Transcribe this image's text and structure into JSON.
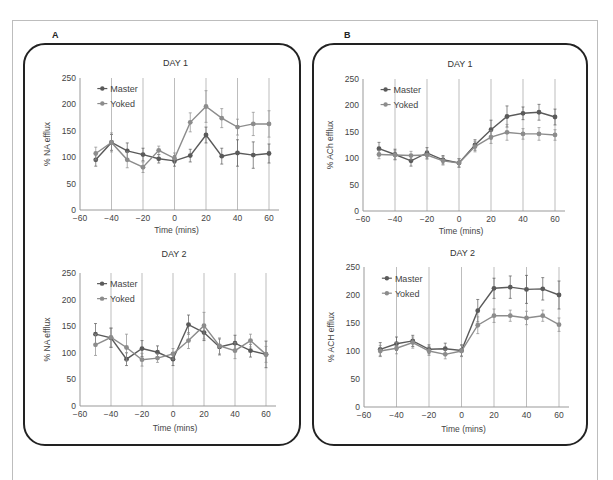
{
  "figure": {
    "panels": [
      {
        "letter": "A"
      },
      {
        "letter": "B"
      }
    ]
  },
  "colors": {
    "master": "#5a5a5a",
    "yoked": "#8c8c8c",
    "gridline": "#bdbdbd",
    "axis": "#999999",
    "frame": "#222222"
  },
  "chart_data": [
    {
      "id": "A-day1",
      "panel": "A",
      "type": "line",
      "title": "DAY 1",
      "xlabel": "Time (mins)",
      "ylabel": "% NA efflux",
      "xlim": [
        -60,
        60
      ],
      "ylim": [
        0,
        250
      ],
      "xticks": [
        -60,
        -40,
        -20,
        0,
        20,
        40,
        60
      ],
      "yticks": [
        0,
        50,
        100,
        150,
        200,
        250
      ],
      "vertical_gridlines": [
        -40,
        -20,
        0,
        20,
        40,
        60
      ],
      "legend": [
        "Master",
        "Yoked"
      ],
      "legend_position": "upper left",
      "x": [
        -50,
        -40,
        -30,
        -20,
        -10,
        0,
        10,
        20,
        30,
        40,
        50,
        60
      ],
      "series": [
        {
          "name": "Master",
          "values": [
            95,
            128,
            112,
            105,
            97,
            93,
            103,
            142,
            102,
            108,
            104,
            107
          ],
          "errors": [
            12,
            15,
            15,
            12,
            8,
            10,
            12,
            15,
            15,
            25,
            25,
            18
          ]
        },
        {
          "name": "Yoked",
          "values": [
            107,
            128,
            95,
            81,
            113,
            98,
            166,
            196,
            174,
            157,
            163,
            163
          ],
          "errors": [
            12,
            18,
            15,
            10,
            8,
            10,
            18,
            30,
            18,
            15,
            22,
            25
          ]
        }
      ]
    },
    {
      "id": "A-day2",
      "panel": "A",
      "type": "line",
      "title": "DAY 2",
      "xlabel": "Time (mins)",
      "ylabel": "% NA efflux",
      "xlim": [
        -60,
        60
      ],
      "ylim": [
        0,
        250
      ],
      "xticks": [
        -60,
        -40,
        -20,
        0,
        20,
        40,
        60
      ],
      "yticks": [
        0,
        50,
        100,
        150,
        200,
        250
      ],
      "vertical_gridlines": [
        -40,
        -20,
        0,
        20,
        40,
        60
      ],
      "legend": [
        "Master",
        "Yoked"
      ],
      "legend_position": "upper left",
      "x": [
        -50,
        -40,
        -30,
        -20,
        -10,
        0,
        10,
        20,
        30,
        40,
        50,
        60
      ],
      "series": [
        {
          "name": "Master",
          "values": [
            135,
            128,
            88,
            108,
            101,
            88,
            153,
            138,
            111,
            118,
            104,
            97
          ],
          "errors": [
            20,
            18,
            12,
            15,
            12,
            12,
            18,
            15,
            15,
            15,
            12,
            25
          ]
        },
        {
          "name": "Yoked",
          "values": [
            115,
            129,
            110,
            87,
            90,
            98,
            123,
            151,
            113,
            104,
            123,
            97
          ],
          "errors": [
            20,
            18,
            25,
            12,
            8,
            10,
            15,
            25,
            15,
            15,
            12,
            15
          ]
        }
      ]
    },
    {
      "id": "B-day1",
      "panel": "B",
      "type": "line",
      "title": "DAY 1",
      "xlabel": "Time (mins)",
      "ylabel": "% ACh efflux",
      "xlim": [
        -60,
        60
      ],
      "ylim": [
        0,
        250
      ],
      "xticks": [
        -60,
        -40,
        -20,
        0,
        20,
        40,
        60
      ],
      "yticks": [
        0,
        50,
        100,
        150,
        200,
        250
      ],
      "vertical_gridlines": [
        -40,
        -20,
        0,
        20,
        40,
        60
      ],
      "legend": [
        "Master",
        "Yoked"
      ],
      "legend_position": "upper left",
      "x": [
        -50,
        -40,
        -30,
        -20,
        -10,
        0,
        10,
        20,
        30,
        40,
        50,
        60
      ],
      "series": [
        {
          "name": "Master",
          "values": [
            118,
            107,
            95,
            110,
            97,
            91,
            125,
            154,
            179,
            185,
            187,
            178
          ],
          "errors": [
            12,
            10,
            10,
            10,
            8,
            8,
            10,
            18,
            20,
            12,
            15,
            15
          ]
        },
        {
          "name": "Yoked",
          "values": [
            107,
            106,
            105,
            106,
            95,
            91,
            122,
            140,
            149,
            146,
            146,
            144
          ],
          "errors": [
            8,
            8,
            8,
            8,
            8,
            8,
            10,
            12,
            15,
            10,
            12,
            10
          ]
        }
      ]
    },
    {
      "id": "B-day2",
      "panel": "B",
      "type": "line",
      "title": "DAY 2",
      "xlabel": "Time (mins)",
      "ylabel": "% ACH efflux",
      "xlim": [
        -60,
        60
      ],
      "ylim": [
        0,
        250
      ],
      "xticks": [
        -60,
        -40,
        -20,
        0,
        20,
        40,
        60
      ],
      "yticks": [
        0,
        50,
        100,
        150,
        200,
        250
      ],
      "vertical_gridlines": [
        -40,
        -20,
        0,
        20,
        40,
        60
      ],
      "legend": [
        "Master",
        "Yoked"
      ],
      "legend_position": "upper left",
      "x": [
        -50,
        -40,
        -30,
        -20,
        -10,
        0,
        10,
        20,
        30,
        40,
        50,
        60
      ],
      "series": [
        {
          "name": "Master",
          "values": [
            103,
            113,
            118,
            103,
            104,
            101,
            172,
            212,
            214,
            210,
            211,
            200
          ],
          "errors": [
            12,
            12,
            10,
            8,
            10,
            10,
            20,
            18,
            20,
            25,
            20,
            25
          ]
        },
        {
          "name": "Yoked",
          "values": [
            100,
            105,
            115,
            100,
            94,
            100,
            146,
            163,
            163,
            159,
            163,
            147
          ],
          "errors": [
            10,
            10,
            10,
            8,
            8,
            10,
            15,
            12,
            10,
            12,
            10,
            12
          ]
        }
      ]
    }
  ]
}
